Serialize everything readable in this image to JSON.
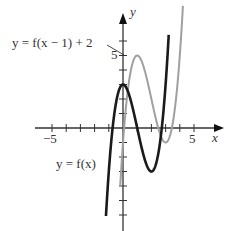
{
  "chart_data": {
    "type": "line",
    "title": "",
    "xlabel": "x",
    "ylabel": "y",
    "xlim": [
      -6,
      7
    ],
    "ylim": [
      -7,
      8
    ],
    "x_ticks": [
      -5,
      -4,
      -3,
      -2,
      -1,
      1,
      2,
      3,
      4,
      5
    ],
    "x_tick_labels": {
      "-5": "−5",
      "5": "5"
    },
    "y_ticks": [
      -6,
      -5,
      -4,
      -3,
      -2,
      -1,
      1,
      2,
      3,
      4,
      5,
      6
    ],
    "y_tick_labels": {
      "5": "5"
    },
    "grid": false,
    "series": [
      {
        "name": "y = f(x)",
        "color": "#1a1a1a",
        "key_points": [
          {
            "x": -1.2,
            "y": -6.0,
            "note": "lower end"
          },
          {
            "x": 0,
            "y": 3,
            "note": "local max"
          },
          {
            "x": 2,
            "y": -3,
            "note": "local min"
          },
          {
            "x": 3.2,
            "y": 5.5,
            "note": "upper end"
          }
        ]
      },
      {
        "name": "y = f(x − 1) + 2",
        "color": "#a0a0a0",
        "key_points": [
          {
            "x": -0.2,
            "y": -4.0,
            "note": "lower end"
          },
          {
            "x": 1,
            "y": 5,
            "note": "local max"
          },
          {
            "x": 3,
            "y": -1,
            "note": "local min"
          },
          {
            "x": 4.2,
            "y": 7.5,
            "note": "upper end"
          }
        ]
      }
    ],
    "annotations": [
      {
        "text": "y = f(x − 1) + 2",
        "points_to": "gray curve"
      },
      {
        "text": "y = f(x)",
        "points_to": "black curve"
      }
    ]
  },
  "labels": {
    "x_axis": "x",
    "y_axis": "y",
    "tick_neg5": "−5",
    "tick_pos5": "5",
    "tick_y5": "5",
    "shifted_label": "y = f(x − 1) + 2",
    "base_label": "y = f(x)"
  }
}
